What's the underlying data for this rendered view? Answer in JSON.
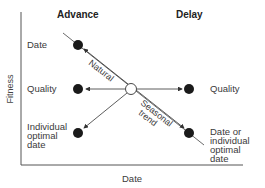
{
  "headers": {
    "advance": "Advance",
    "delay": "Delay"
  },
  "axes": {
    "x_label": "Date",
    "y_label": "Fitness"
  },
  "left_labels": {
    "date": "Date",
    "quality": "Quality",
    "individual_optimal_date": [
      "Individual",
      "optimal",
      "date"
    ]
  },
  "right_labels": {
    "quality": "Quality",
    "date_or_individual_optimal_date": [
      "Date or",
      "individual",
      "optimal",
      "date"
    ]
  },
  "arrow_labels": {
    "natural": "Natural",
    "seasonal_trend": [
      "Seasonal",
      "trend"
    ]
  },
  "colors": {
    "line": "#333333",
    "dot": "#1a1a1a",
    "text": "#3a3a3a"
  }
}
